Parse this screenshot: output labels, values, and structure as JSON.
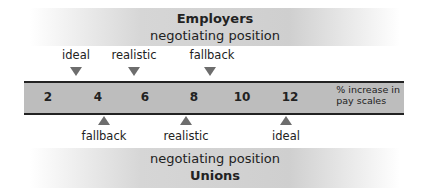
{
  "employers": {
    "title": "Employers",
    "subtitle": "negotiating position",
    "markers": [
      {
        "label": "ideal",
        "value": 3.5
      },
      {
        "label": "realistic",
        "value": 5.5
      },
      {
        "label": "fallback",
        "value": 8.5
      }
    ]
  },
  "scale": {
    "ticks": [
      "2",
      "4",
      "6",
      "8",
      "10",
      "12"
    ],
    "unit_line1": "% increase in",
    "unit_line2": "pay scales"
  },
  "unions": {
    "title": "Unions",
    "subtitle": "negotiating position",
    "markers": [
      {
        "label": "fallback",
        "value": 4
      },
      {
        "label": "realistic",
        "value": 8
      },
      {
        "label": "ideal",
        "value": 12
      }
    ]
  }
}
